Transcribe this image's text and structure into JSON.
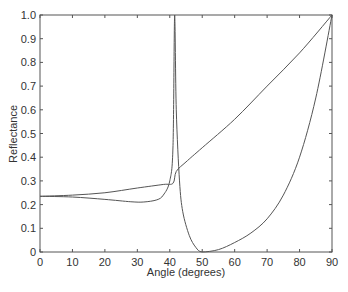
{
  "chart_data": {
    "type": "line",
    "title": "",
    "xlabel": "Angle (degrees)",
    "ylabel": "Reflectance",
    "xlim": [
      0,
      90
    ],
    "ylim": [
      0,
      1.0
    ],
    "xticks": [
      "0",
      "10",
      "20",
      "30",
      "40",
      "50",
      "60",
      "70",
      "80",
      "90"
    ],
    "yticks": [
      "0",
      "0.1",
      "0.2",
      "0.3",
      "0.4",
      "0.5",
      "0.6",
      "0.7",
      "0.8",
      "0.9",
      "1.0"
    ],
    "grid": false,
    "legend": null,
    "series": [
      {
        "name": "upper curve",
        "x": [
          0,
          10,
          20,
          30,
          38,
          41,
          42,
          45,
          50,
          60,
          70,
          80,
          90
        ],
        "y": [
          0.235,
          0.24,
          0.25,
          0.27,
          0.285,
          0.29,
          0.34,
          0.38,
          0.44,
          0.56,
          0.7,
          0.84,
          1.0
        ]
      },
      {
        "name": "lower curve",
        "x": [
          0,
          10,
          20,
          28,
          32,
          36,
          38,
          40,
          41,
          41.5,
          42,
          43,
          44,
          46,
          48,
          50,
          55,
          60,
          65,
          70,
          75,
          80,
          85,
          90
        ],
        "y": [
          0.235,
          0.232,
          0.222,
          0.212,
          0.211,
          0.22,
          0.24,
          0.3,
          0.45,
          1.0,
          0.6,
          0.3,
          0.17,
          0.07,
          0.02,
          0.0,
          0.01,
          0.04,
          0.08,
          0.14,
          0.24,
          0.4,
          0.65,
          1.0
        ]
      }
    ]
  }
}
